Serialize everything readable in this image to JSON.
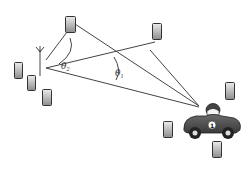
{
  "diagram": {
    "type": "signal-angle-of-arrival",
    "labels": {
      "theta_2": "θ",
      "theta_2_sub": "2",
      "theta_1": "θ",
      "theta_1_sub": "1"
    },
    "car_number": "1",
    "nodes": [
      {
        "id": "phone-top-left",
        "x": 65,
        "y": 16
      },
      {
        "id": "phone-top-right",
        "x": 152,
        "y": 23
      },
      {
        "id": "antenna",
        "x": 40,
        "y": 50
      },
      {
        "id": "phone-left-1",
        "x": 14,
        "y": 62
      },
      {
        "id": "phone-left-2",
        "x": 27,
        "y": 75
      },
      {
        "id": "phone-left-3",
        "x": 42,
        "y": 89
      },
      {
        "id": "phone-right",
        "x": 225,
        "y": 82
      },
      {
        "id": "phone-lower-mid",
        "x": 163,
        "y": 121
      },
      {
        "id": "phone-bottom",
        "x": 212,
        "y": 141
      },
      {
        "id": "car",
        "x": 183,
        "y": 105
      }
    ],
    "colors": {
      "line": "#444444",
      "phone_fill_top": "#e0e0e0",
      "phone_fill_bottom": "#8a8a8a",
      "phone_stroke": "#333333",
      "car_body": "#555555"
    }
  }
}
